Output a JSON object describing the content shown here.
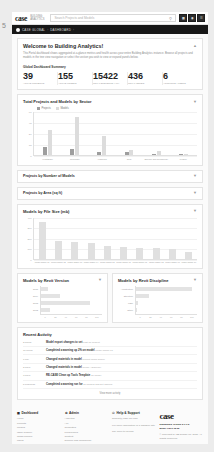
{
  "page_marker": "5",
  "header": {
    "brand": "case",
    "brand_sub": "BUILDING\nANALYTICS",
    "search_placeholder": "Search Projects and Models",
    "search_icon": "search-icon",
    "nav_buttons": [
      {
        "name": "grid-icon",
        "glyph": "☰"
      },
      {
        "name": "bell-icon",
        "glyph": "◉"
      },
      {
        "name": "user-icon",
        "glyph": "☰"
      }
    ]
  },
  "breadcrumb": {
    "icon": "home-icon",
    "items": [
      "CASE GLOBAL",
      "DASHBOARD"
    ],
    "separator": "›"
  },
  "welcome": {
    "title": "Welcome to Building Analytics!",
    "collapse_icon": "chevron-up-icon",
    "paragraph": "This Portal dashboard shows aggregated at-a-glance metrics and health across your entire Building Analytics instance. Browse all projects and models in the tree view navigation or select the section you wish to view or expand panels below.",
    "stats_label": "Global Dashboard Summary",
    "stats": [
      {
        "value": "39",
        "label": "ACTIVE PROJECTS"
      },
      {
        "value": "155",
        "label": "ACTIVE MODELS"
      },
      {
        "value": "15422",
        "label": "TOTAL ELEMENTS (ALL)"
      },
      {
        "value": "436",
        "label": "TOTAL ISSUES"
      },
      {
        "value": "6",
        "label": "ACCOUNTS / USERS"
      }
    ]
  },
  "sector_chart": {
    "title": "Total Projects and Models by Sector",
    "collapse_icon": "chevron-down-icon",
    "chart_data": {
      "type": "bar",
      "title": "Total Projects and Models by Sector",
      "categories": [
        "Healthcare",
        "Corporate",
        "Academic",
        "Civic",
        "Science and Technology",
        "Leisure"
      ],
      "series": [
        {
          "name": "Projects",
          "color": "#9e9e9e",
          "values": [
            11,
            9,
            5,
            4,
            2,
            1
          ]
        },
        {
          "name": "Models",
          "color": "#dcdcdc",
          "values": [
            35,
            52,
            26,
            7,
            6,
            2
          ]
        }
      ],
      "ylim": [
        0,
        60
      ],
      "yticks": [
        0,
        15,
        30,
        45,
        60
      ],
      "xlabel": "",
      "ylabel": "",
      "grid": true,
      "legend": "top-left"
    }
  },
  "accordions": [
    {
      "title": "Projects by Number of Models",
      "collapse_icon": "chevron-down-icon"
    },
    {
      "title": "Projects by Area (sq ft)",
      "collapse_icon": "chevron-down-icon"
    }
  ],
  "size_chart": {
    "title": "Models by File Size (mb)",
    "collapse_icon": "chevron-down-icon",
    "chart_data": {
      "type": "bar",
      "title": "Models by File Size (mb)",
      "categories": [
        "Model Name 01",
        "Model Name 02",
        "Model Name 03",
        "Model Name 04",
        "Model Name 05",
        "Model Name 06",
        "Model Name 07",
        "Model Name 08",
        "Model Name 09",
        "Model Name 10"
      ],
      "values": [
        345,
        168,
        160,
        152,
        118,
        112,
        105,
        100,
        92,
        62
      ],
      "ylim": [
        0,
        400
      ],
      "yticks": [
        0,
        100,
        200,
        300,
        400
      ],
      "color": "#e0e0e0",
      "grid": true
    }
  },
  "version_chart": {
    "title": "Models by Revit Version",
    "collapse_icon": "chevron-down-icon",
    "chart_data": {
      "type": "bar",
      "orientation": "horizontal",
      "title": "Models by Revit Version",
      "categories": [
        "2015",
        "2014",
        "2013",
        "2012"
      ],
      "values": [
        12,
        31,
        81,
        14
      ],
      "xlim": [
        0,
        100
      ],
      "xticks": [
        0,
        20,
        40,
        60,
        80,
        100
      ],
      "color": "#e3e3e3"
    }
  },
  "discipline_chart": {
    "title": "Models by Revit Discipline",
    "collapse_icon": "chevron-down-icon",
    "chart_data": {
      "type": "bar",
      "orientation": "horizontal",
      "title": "Models by Revit Discipline",
      "categories": [
        "Architecture",
        "Structure",
        "MEP",
        "Other"
      ],
      "values": [
        92,
        22,
        3,
        1
      ],
      "xlim": [
        0,
        100
      ],
      "xticks": [
        0,
        20,
        40,
        60,
        80,
        100
      ],
      "color": "#e3e3e3"
    }
  },
  "activity": {
    "title": "Recent Activity",
    "more_label": "View more activity",
    "rows": [
      {
        "time": "2 hours",
        "text": "Model export changes to set",
        "meta": "post on Project"
      },
      {
        "time": "11 hours",
        "text": "Completed a warning up 2% on model",
        "meta": "Model Name 01"
      },
      {
        "time": "1 day",
        "text": "Changed materials in model",
        "meta": "Project Team Space"
      },
      {
        "time": "2 days",
        "text": "Changed materials in model",
        "meta": "Room Adjacency"
      },
      {
        "time": "3 days",
        "text": "RE-CASE Clean up Tools Template",
        "meta": "on model"
      },
      {
        "time": "5 business",
        "text": "Completed a warning run for",
        "meta": "all models and set owners"
      }
    ]
  },
  "footer": {
    "columns": [
      {
        "heading": "Dashboard",
        "heading_icon": "dashboard-icon",
        "links": [
          "Home",
          "Projects",
          "Models",
          "Issue Tracker",
          "Clash Tracker",
          "Users"
        ]
      },
      {
        "heading": "Admin",
        "heading_icon": "gear-icon",
        "links": [
          "Analytics",
          "API",
          "Templates",
          "Preferences",
          "Content",
          "Science and Technology"
        ]
      }
    ],
    "support": {
      "heading": "Help & Support",
      "heading_icon": "help-icon",
      "email": "support@case-inc.com",
      "lines": [
        "For more information or a sandbox site",
        "Say hello to us now"
      ]
    },
    "brand": "case",
    "version_label": "Dashboard Version 2.1.1.2",
    "release_label": "Minor Fixes 12.02",
    "copyright": "© Copyright CASE Design Inc. 2015. All Rights Reserved."
  }
}
